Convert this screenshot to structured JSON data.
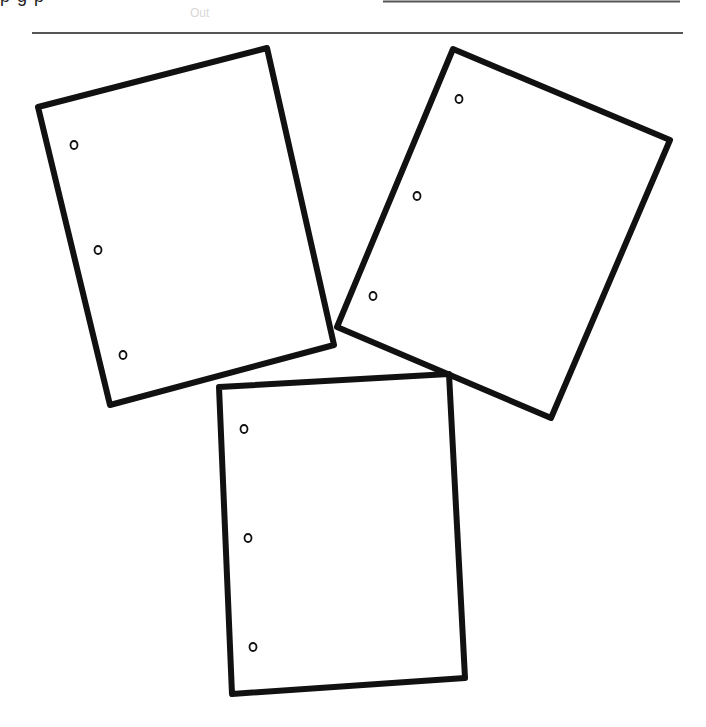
{
  "header": {
    "clipped_text": "p g p",
    "ghost_text": "Out"
  },
  "colors": {
    "stroke": "#111111",
    "rule": "#555555",
    "background": "#ffffff"
  },
  "figure": {
    "papers": [
      {
        "id": "left",
        "corners": [
          [
            38,
            107
          ],
          [
            267,
            48
          ],
          [
            334,
            345
          ],
          [
            110,
            405
          ]
        ],
        "holes": [
          [
            74,
            145
          ],
          [
            98,
            250
          ],
          [
            123,
            355
          ]
        ]
      },
      {
        "id": "right",
        "corners": [
          [
            453,
            49
          ],
          [
            670,
            140
          ],
          [
            551,
            418
          ],
          [
            337,
            327
          ]
        ],
        "holes": [
          [
            459,
            99
          ],
          [
            417,
            196
          ],
          [
            373,
            296
          ]
        ]
      },
      {
        "id": "bottom",
        "corners": [
          [
            219,
            387
          ],
          [
            449,
            374
          ],
          [
            465,
            678
          ],
          [
            232,
            694
          ]
        ],
        "holes": [
          [
            244,
            429
          ],
          [
            248,
            538
          ],
          [
            253,
            647
          ]
        ]
      }
    ]
  }
}
